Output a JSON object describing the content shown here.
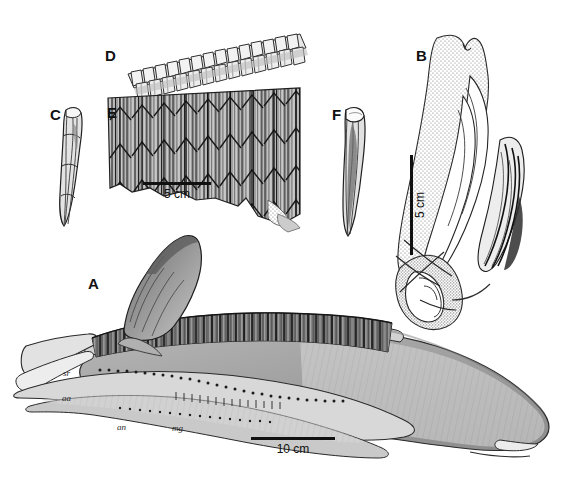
{
  "figure": {
    "background_color": "#ffffff",
    "ink_color": "#111111",
    "width": 573,
    "height": 489
  },
  "panels": [
    {
      "id": "A",
      "label": "A",
      "name": "panel-a-dentary-lateral",
      "caption_text": "A",
      "x": 88,
      "y": 276,
      "subject": "complete left dentary in lateral view with dental battery and coronoid process"
    },
    {
      "id": "B",
      "label": "B",
      "name": "panel-b-element-stippled",
      "caption_text": "B",
      "x": 416,
      "y": 48,
      "subject": "stippled bone element in oblique view with overlapping laminae"
    },
    {
      "id": "C",
      "label": "C",
      "name": "panel-c-tooth-lateral",
      "caption_text": "C",
      "x": 50,
      "y": 107,
      "subject": "isolated elongate tooth in lateral view"
    },
    {
      "id": "D",
      "label": "D",
      "name": "panel-d-tooth-row-occlusal",
      "caption_text": "D",
      "x": 105,
      "y": 48,
      "subject": "row of tooth crowns in occlusal view"
    },
    {
      "id": "E",
      "label": "E",
      "name": "panel-e-tooth-battery-lingual",
      "caption_text": "E",
      "x": 107,
      "y": 105,
      "subject": "dental battery in lingual view showing vertical tooth columns"
    },
    {
      "id": "F",
      "label": "F",
      "name": "panel-f-tooth-lateral",
      "caption_text": "F",
      "x": 332,
      "y": 107,
      "subject": "isolated elongate tooth in lateral view"
    }
  ],
  "scale_bars": [
    {
      "id": "scale-e",
      "name": "scale-bar-5cm-panel-e",
      "label": "5 cm",
      "orientation": "horizontal",
      "x": 143,
      "y": 182,
      "length_px": 68
    },
    {
      "id": "scale-b",
      "name": "scale-bar-5cm-panel-b",
      "label": "5 cm",
      "orientation": "vertical",
      "x": 410,
      "y": 155,
      "length_px": 100
    },
    {
      "id": "scale-a",
      "name": "scale-bar-10cm-panel-a",
      "label": "10 cm",
      "orientation": "horizontal",
      "x": 251,
      "y": 437,
      "length_px": 84
    }
  ],
  "anatomical_labels": [
    {
      "id": "sr",
      "text": "sr",
      "name": "anatomical-label-sr",
      "x": 63,
      "y": 369
    },
    {
      "id": "aa",
      "text": "aa",
      "name": "anatomical-label-aa",
      "x": 62,
      "y": 394
    },
    {
      "id": "an",
      "text": "an",
      "name": "anatomical-label-an",
      "x": 117,
      "y": 423
    },
    {
      "id": "mg",
      "text": "mg",
      "name": "anatomical-label-mg",
      "x": 172,
      "y": 424
    }
  ]
}
